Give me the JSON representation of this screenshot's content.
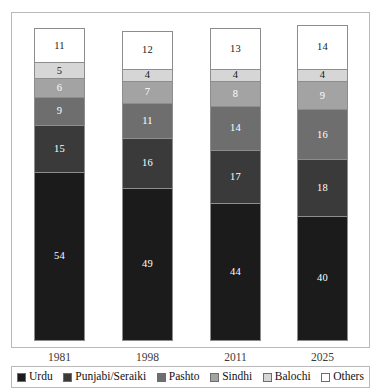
{
  "chart_data": {
    "type": "bar",
    "subtype": "stacked-vertical-100pct",
    "title": "",
    "xlabel": "",
    "ylabel": "",
    "ylim": [
      0,
      100
    ],
    "grid": false,
    "legend_position": "bottom",
    "categories": [
      "1981",
      "1998",
      "2011",
      "2025"
    ],
    "stack_order_bottom_to_top": [
      "Urdu",
      "Punjabi/Seraiki",
      "Pashto",
      "Sindhi",
      "Balochi",
      "Others"
    ],
    "series": [
      {
        "name": "Urdu",
        "color": "#1b1b1b",
        "label_color": "#ffffff",
        "values": [
          54,
          49,
          44,
          40
        ]
      },
      {
        "name": "Punjabi/Seraiki",
        "color": "#3a3a3a",
        "label_color": "#ffffff",
        "values": [
          15,
          16,
          17,
          18
        ]
      },
      {
        "name": "Pashto",
        "color": "#6e6e6e",
        "label_color": "#ffffff",
        "values": [
          9,
          11,
          14,
          16
        ]
      },
      {
        "name": "Sindhi",
        "color": "#a3a3a3",
        "label_color": "#ffffff",
        "values": [
          6,
          7,
          8,
          9
        ]
      },
      {
        "name": "Balochi",
        "color": "#d6d6d6",
        "label_color": "#1a1a1a",
        "values": [
          5,
          4,
          4,
          4
        ]
      },
      {
        "name": "Others",
        "color": "#ffffff",
        "label_color": "#1a1a1a",
        "values": [
          11,
          12,
          13,
          14
        ]
      }
    ]
  },
  "legend": {
    "items": [
      {
        "label": "Urdu",
        "color": "#1b1b1b"
      },
      {
        "label": "Punjabi/Seraiki",
        "color": "#3a3a3a"
      },
      {
        "label": "Pashto",
        "color": "#6e6e6e"
      },
      {
        "label": "Sindhi",
        "color": "#a3a3a3"
      },
      {
        "label": "Balochi",
        "color": "#d6d6d6"
      },
      {
        "label": "Others",
        "color": "#ffffff"
      }
    ]
  },
  "axis": {
    "tick_labels": [
      "1981",
      "1998",
      "2011",
      "2025"
    ]
  },
  "style": {
    "frame_color": "#b9b9b9",
    "segment_border": "#8d8d8d",
    "background": "#ffffff"
  }
}
